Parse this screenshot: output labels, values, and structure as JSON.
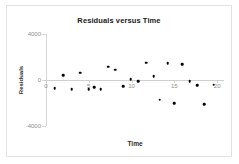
{
  "chart_data": {
    "type": "scatter",
    "title": "Residuals versus Time",
    "xlabel": "Time",
    "ylabel": "Residuals",
    "xlim": [
      0,
      20.8
    ],
    "ylim": [
      -4000,
      4000
    ],
    "xticks": [
      0,
      5,
      10,
      15,
      20
    ],
    "xtick_labels": [
      "0",
      "5",
      "10",
      "15",
      "20"
    ],
    "yticks": [
      4000,
      0,
      -4000
    ],
    "ytick_labels": [
      "4000",
      "0",
      "-4000"
    ],
    "grid": false,
    "legend": "none",
    "zero_reference_line": 0,
    "marker_color": "#000000",
    "axis_color": "#cfcfcf",
    "series": [
      {
        "name": "Residuals",
        "x": [
          1.0,
          2.0,
          3.0,
          4.0,
          5.0,
          5.6,
          6.4,
          7.3,
          8.1,
          9.0,
          9.9,
          10.8,
          11.7,
          12.6,
          13.3,
          14.2,
          15.0,
          15.9,
          16.8,
          17.7,
          18.5,
          19.6
        ],
        "y": [
          -700,
          420,
          -800,
          650,
          -800,
          -640,
          -800,
          1150,
          880,
          -560,
          80,
          -100,
          1500,
          330,
          -1700,
          1450,
          -2000,
          1350,
          -130,
          -450,
          -2100,
          -400
        ]
      }
    ],
    "point_count": 22
  }
}
